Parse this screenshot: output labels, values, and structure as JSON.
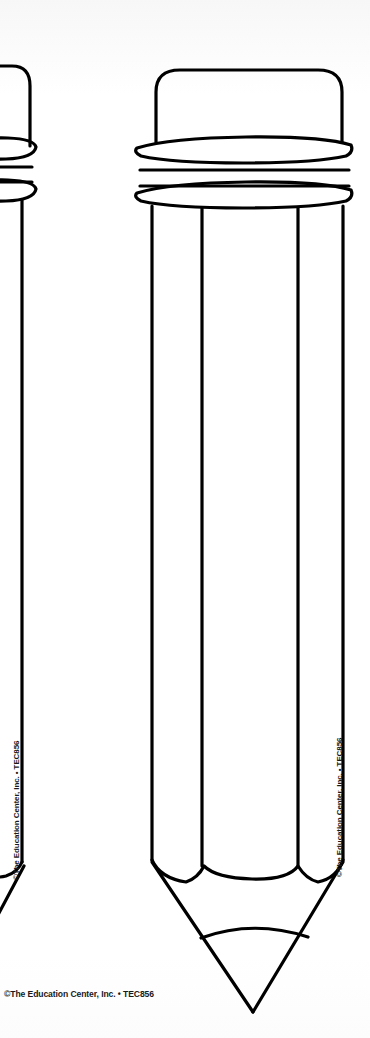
{
  "page": {
    "width": 370,
    "height": 1038,
    "background_color": "#fdfdfd",
    "ink_color": "#000000"
  },
  "credits": {
    "bottom_left": "©The Education Center, Inc. • TEC856",
    "left_pencil_vertical": "©The Education Center, Inc. • TEC856",
    "right_pencil_vertical": "©The Education Center, Inc. • TEC856",
    "product_code": "TEC856",
    "publisher": "The Education Center, Inc."
  },
  "artwork": {
    "shapes": [
      {
        "name": "pencil-partial-left",
        "label": "Partial pencil outline cropped at left page edge",
        "parts": [
          "eraser",
          "ferrule-ring-upper",
          "ferrule-band",
          "ferrule-ring-lower",
          "barrel",
          "wood-point",
          "graphite-tip"
        ]
      },
      {
        "name": "pencil-full-center",
        "label": "Full pencil outline with eraser, ferrule, faceted barrel and sharpened point",
        "parts": [
          "eraser",
          "ferrule-ring-upper",
          "ferrule-band",
          "ferrule-ring-lower",
          "barrel",
          "barrel-facet-left",
          "barrel-facet-right",
          "wood-point",
          "graphite-tip"
        ]
      }
    ]
  }
}
